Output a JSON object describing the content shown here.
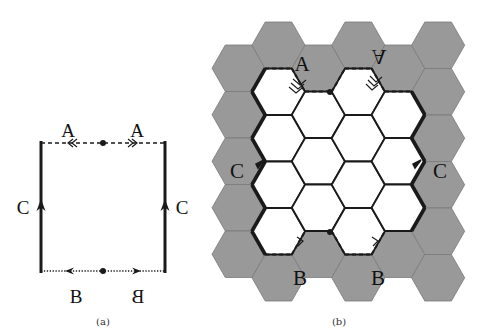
{
  "panels": {
    "a": {
      "caption": "(a)",
      "square": {
        "left": 41,
        "right": 165,
        "top": 143,
        "bottom": 271
      },
      "edges": {
        "top": {
          "style": "dashed",
          "label_left": "A",
          "label_right": "A",
          "arrow_left": "double-left",
          "arrow_right": "double-right"
        },
        "bottom": {
          "style": "dotted",
          "label_left": "B",
          "label_right": "B",
          "label_right_mirrored": true,
          "arrow_left": "single-left",
          "arrow_right": "single-right"
        },
        "left": {
          "style": "solid-thick",
          "label": "C",
          "arrow": "up"
        },
        "right": {
          "style": "solid-thick",
          "label": "C",
          "arrow": "up"
        }
      },
      "midpoints": [
        {
          "x": 103,
          "y": 143
        },
        {
          "x": 103,
          "y": 271
        }
      ]
    },
    "b": {
      "caption": "(b)",
      "hex": {
        "origin_x": 212,
        "side": 26.6,
        "height": 46.5,
        "col_step": 39.9,
        "even_col_top": 45,
        "odd_col_top": 22
      },
      "columns": [
        {
          "col": 0,
          "rows": [
            "gray",
            "gray",
            "gray",
            "gray",
            "gray"
          ]
        },
        {
          "col": 1,
          "rows": [
            "gray",
            "white",
            "white",
            "white",
            "white",
            "gray"
          ]
        },
        {
          "col": 2,
          "rows": [
            "gray",
            "white",
            "white",
            "white",
            "gray"
          ]
        },
        {
          "col": 3,
          "rows": [
            "gray",
            "white",
            "white",
            "white",
            "white",
            "gray"
          ]
        },
        {
          "col": 4,
          "rows": [
            "gray",
            "white",
            "white",
            "white",
            "gray"
          ]
        },
        {
          "col": 5,
          "rows": [
            "gray",
            "gray",
            "gray",
            "gray",
            "gray",
            "gray"
          ]
        }
      ],
      "labels": [
        {
          "text": "A",
          "x": 297,
          "y": 67,
          "mirrored": false
        },
        {
          "text": "A",
          "x": 379,
          "y": 67,
          "mirrored": true,
          "upside_down": true
        },
        {
          "text": "C",
          "x": 237,
          "y": 172,
          "mirrored": false
        },
        {
          "text": "C",
          "x": 440,
          "y": 172,
          "mirrored": false
        },
        {
          "text": "B",
          "x": 300,
          "y": 278,
          "mirrored": false
        },
        {
          "text": "B",
          "x": 378,
          "y": 278,
          "mirrored": false
        }
      ],
      "midpoints": [
        {
          "x": 330,
          "y": 92
        },
        {
          "x": 330,
          "y": 232
        }
      ]
    }
  },
  "colors": {
    "gray_hex": "#999999",
    "gray_hex_stroke": "#7a7a7a",
    "white_hex": "#ffffff",
    "line": "#1a1a1a",
    "caption": "#333333"
  }
}
